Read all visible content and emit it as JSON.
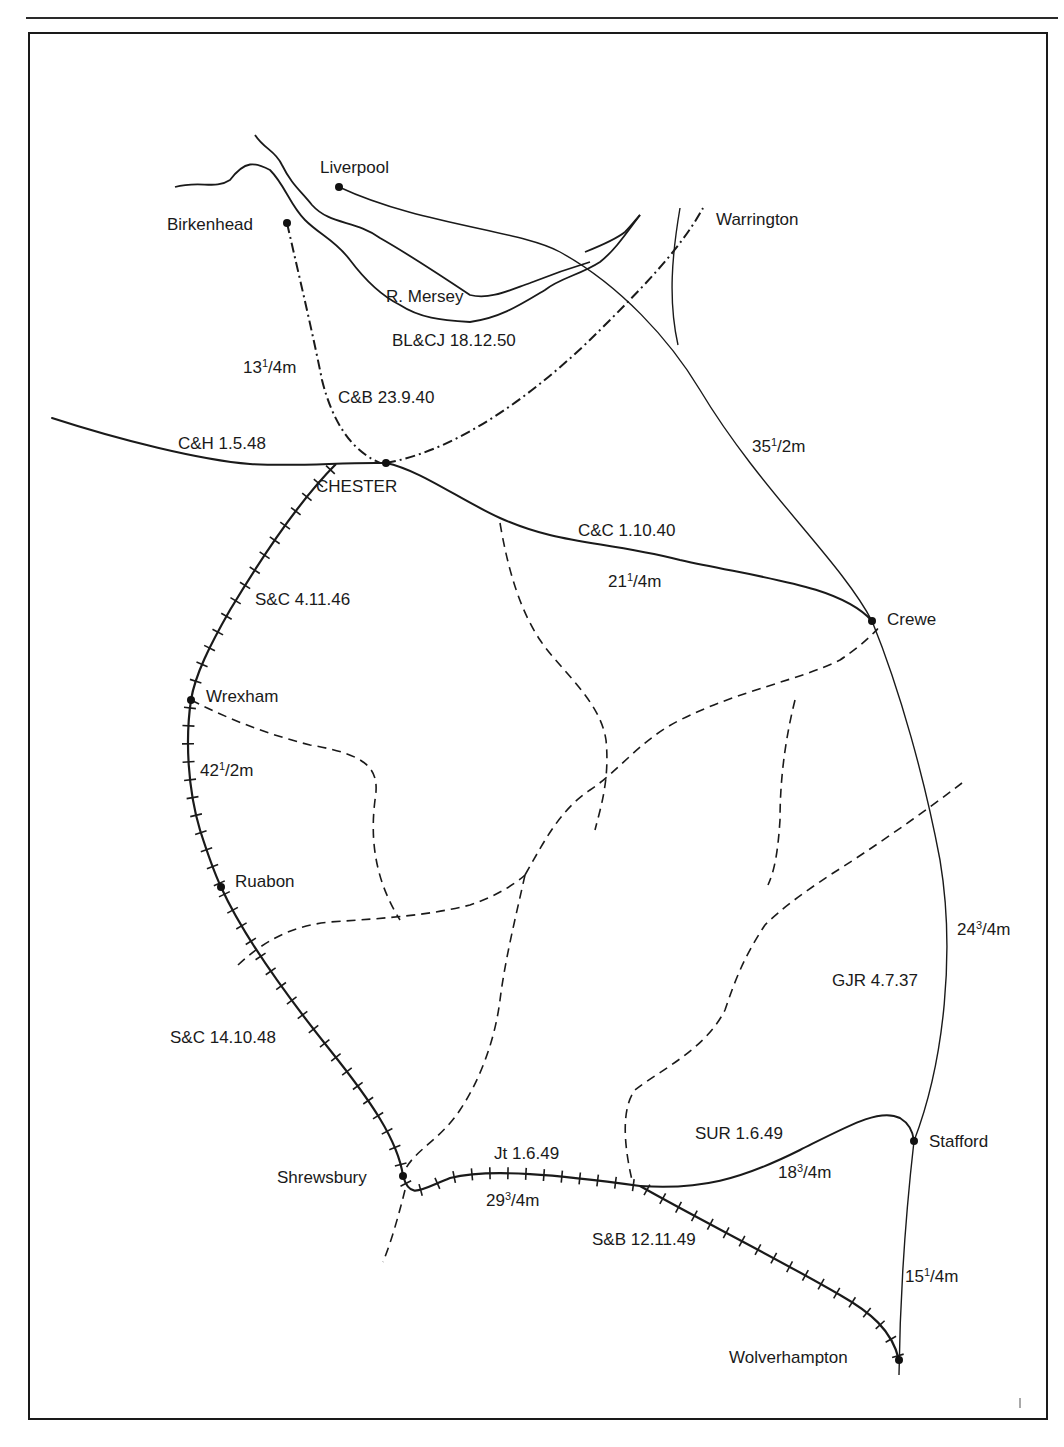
{
  "page": {
    "width": 1064,
    "height": 1447,
    "colors": {
      "ink": "#1a1a1a",
      "paper": "#ffffff"
    }
  },
  "map": {
    "rivers": [
      {
        "name": "R. Mersey",
        "label": "R. Mersey",
        "paths": [
          "M255 135 C265 150 275 150 282 165 C292 185 300 190 312 205 C330 225 355 220 380 238 C410 255 440 275 470 295 C490 300 510 290 530 283 C550 275 570 268 590 262",
          "M175 187 C200 180 215 190 230 180 C245 160 255 162 270 170 C285 185 290 205 305 220 C320 235 335 240 350 260 C365 280 380 295 400 305 C420 318 440 320 470 322 C500 318 520 305 545 290 C560 278 580 275 600 262 C615 250 625 235 640 215",
          "M585 252 C600 246 615 240 625 232 C632 225 637 218 640 215"
        ]
      }
    ],
    "stations": [
      {
        "id": "liverpool",
        "label": "Liverpool",
        "x": 339,
        "y": 187,
        "lx": 320,
        "ly": 173
      },
      {
        "id": "birkenhead",
        "label": "Birkenhead",
        "x": 287,
        "y": 223,
        "lx": 167,
        "ly": 230
      },
      {
        "id": "chester",
        "label": "CHESTER",
        "x": 386,
        "y": 463,
        "lx": 316,
        "ly": 492
      },
      {
        "id": "crewe",
        "label": "Crewe",
        "x": 872,
        "y": 621,
        "lx": 887,
        "ly": 625
      },
      {
        "id": "wrexham",
        "label": "Wrexham",
        "x": 191,
        "y": 700,
        "lx": 206,
        "ly": 702
      },
      {
        "id": "ruabon",
        "label": "Ruabon",
        "x": 221,
        "y": 887,
        "lx": 235,
        "ly": 887
      },
      {
        "id": "shrewsbury",
        "label": "Shrewsbury",
        "x": 403,
        "y": 1176,
        "lx": 277,
        "ly": 1183
      },
      {
        "id": "stafford",
        "label": "Stafford",
        "x": 914,
        "y": 1141,
        "lx": 929,
        "ly": 1147
      },
      {
        "id": "wolverhampton",
        "label": "Wolverhampton",
        "x": 899,
        "y": 1360,
        "lx": 729,
        "ly": 1363
      },
      {
        "id": "warrington",
        "label": "Warrington",
        "x": 0,
        "y": 0,
        "lx": 716,
        "ly": 225,
        "no_dot": true
      }
    ],
    "lines": [
      {
        "id": "gjr",
        "label": "GJR 4.7.37",
        "distance": [
          "24",
          "3",
          "/4m"
        ],
        "style": "thin",
        "path": "M339 187 C420 225 520 230 560 252 C620 285 670 340 700 390 C760 490 840 560 872 621 C900 690 925 780 940 860 C955 950 945 1060 914 1141 C905 1220 900 1300 899 1375"
      },
      {
        "id": "gjr-warrington",
        "label": "",
        "style": "thin",
        "path": "M680 208 C672 255 668 300 678 345"
      },
      {
        "id": "blcj",
        "label": "BL&CJ 18.12.50",
        "style": "dashdot",
        "path": "M386 463 C460 450 540 390 600 330 C640 290 680 250 703 208"
      },
      {
        "id": "cb",
        "label": "C&B 23.9.40",
        "distance": [
          "13",
          "1",
          "/4m"
        ],
        "style": "dashdot",
        "path": "M287 223 C300 280 312 330 322 380 C332 420 350 450 380 463"
      },
      {
        "id": "ch",
        "label": "C&H 1.5.48",
        "style": "solid",
        "path": "M52 418 C120 440 200 460 250 464 C300 467 340 462 386 463"
      },
      {
        "id": "cc",
        "label": "C&C 1.10.40",
        "distance": [
          "21",
          "1",
          "/4m"
        ],
        "style": "solid",
        "path": "M386 463 C420 470 460 500 500 518 C560 545 600 540 680 560 C760 578 840 585 872 621"
      },
      {
        "id": "sc-north",
        "label": "S&C 4.11.46",
        "style": "ticked",
        "path": "M336 464 C300 500 260 560 230 610 C210 645 195 675 191 700"
      },
      {
        "id": "sc-mid",
        "label": "",
        "distance": [
          "42",
          "1",
          "/2m"
        ],
        "style": "ticked",
        "path": "M191 700 C185 740 188 790 200 830 C208 855 214 872 221 887"
      },
      {
        "id": "sc-south",
        "label": "S&C 14.10.48",
        "style": "ticked",
        "path": "M221 887 C245 940 290 1000 330 1050 C370 1100 398 1140 403 1176"
      },
      {
        "id": "jt",
        "label": "Jt 1.6.49",
        "distance": [
          "29",
          "3",
          "/4m"
        ],
        "style": "ticked",
        "path": "M403 1176 C410 1200 420 1190 450 1178 C490 1168 560 1175 640 1186"
      },
      {
        "id": "sur",
        "label": "SUR 1.6.49",
        "distance": [
          "18",
          "3",
          "/4m"
        ],
        "style": "solid",
        "path": "M640 1186 C700 1190 740 1180 800 1150 C850 1125 880 1108 900 1118 C910 1124 913 1132 914 1141"
      },
      {
        "id": "sb",
        "label": "S&B 12.11.49",
        "style": "ticked",
        "path": "M640 1186 C700 1220 780 1260 840 1295 C870 1312 892 1330 899 1360"
      },
      {
        "id": "gjr-stafford-wolves",
        "label": "",
        "distance": [
          "15",
          "1",
          "/4m"
        ],
        "style": "none",
        "path": ""
      }
    ],
    "dashed_lines": [
      "M191 700 C230 720 270 735 310 745 C370 755 380 770 375 800 C370 840 375 880 400 920",
      "M238 965 C270 935 300 925 330 922 C390 918 430 915 470 905 C500 895 520 880 525 875",
      "M500 523 C508 570 520 610 540 640 C560 670 600 700 606 740 C610 780 600 810 595 830",
      "M525 875 C545 840 560 810 590 790 C620 770 640 740 680 720 C740 690 800 680 840 660 C870 640 880 625 877 630",
      "M525 875 C515 920 505 960 500 1000 C495 1040 480 1080 460 1110 C440 1140 415 1150 405 1170",
      "M405 1190 C400 1210 392 1240 383 1262",
      "M795 700 C785 740 780 780 780 820 C778 850 775 870 768 885",
      "M962 783 C920 815 870 850 830 875 C800 895 780 910 765 925 C745 955 735 980 725 1010 C705 1050 660 1070 635 1090 C620 1110 625 1150 632 1180"
    ],
    "labels": [
      {
        "text": "BL&CJ 18.12.50",
        "x": 392,
        "y": 346
      },
      {
        "text": "C&B 23.9.40",
        "x": 338,
        "y": 403
      },
      {
        "text": "C&H 1.5.48",
        "x": 178,
        "y": 449
      },
      {
        "text": "C&C 1.10.40",
        "x": 578,
        "y": 536
      },
      {
        "text": "S&C 4.11.46",
        "x": 255,
        "y": 605
      },
      {
        "text": "GJR 4.7.37",
        "x": 832,
        "y": 986
      },
      {
        "text": "S&C 14.10.48",
        "x": 170,
        "y": 1043
      },
      {
        "text": "Jt 1.6.49",
        "x": 494,
        "y": 1159
      },
      {
        "text": "SUR 1.6.49",
        "x": 695,
        "y": 1139
      },
      {
        "text": "S&B 12.11.49",
        "x": 592,
        "y": 1245
      },
      {
        "text": "R. Mersey",
        "x": 386,
        "y": 302
      }
    ],
    "distances": [
      {
        "whole": "13",
        "num": "1",
        "den": "/4m",
        "x": 243,
        "y": 373
      },
      {
        "whole": "35",
        "num": "1",
        "den": "/2m",
        "x": 752,
        "y": 452
      },
      {
        "whole": "21",
        "num": "1",
        "den": "/4m",
        "x": 608,
        "y": 587
      },
      {
        "whole": "42",
        "num": "1",
        "den": "/2m",
        "x": 200,
        "y": 776
      },
      {
        "whole": "24",
        "num": "3",
        "den": "/4m",
        "x": 957,
        "y": 935
      },
      {
        "whole": "29",
        "num": "3",
        "den": "/4m",
        "x": 486,
        "y": 1206
      },
      {
        "whole": "18",
        "num": "3",
        "den": "/4m",
        "x": 778,
        "y": 1178
      },
      {
        "whole": "15",
        "num": "1",
        "den": "/4m",
        "x": 905,
        "y": 1282
      }
    ]
  }
}
